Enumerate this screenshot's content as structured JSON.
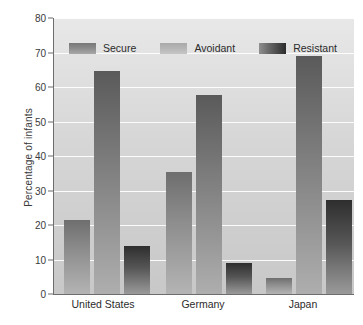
{
  "chart_data": {
    "type": "bar",
    "title": "",
    "xlabel": "",
    "ylabel": "Percentage of infants",
    "ylim": [
      0,
      80
    ],
    "yticks": [
      0,
      10,
      20,
      30,
      40,
      50,
      60,
      70,
      80
    ],
    "grid": true,
    "legend_position": "top-inside",
    "categories": [
      "United States",
      "Germany",
      "Japan"
    ],
    "series": [
      {
        "name": "Secure",
        "values": [
          21.5,
          35.3,
          4.5
        ]
      },
      {
        "name": "Avoidant",
        "values": [
          64.5,
          57.8,
          69.0
        ]
      },
      {
        "name": "Resistant",
        "values": [
          14.0,
          9.0,
          27.2
        ]
      }
    ]
  },
  "axes": {
    "y_label": "Percentage of infants",
    "y_tick_labels": [
      "80",
      "70",
      "60",
      "50",
      "40",
      "30",
      "20",
      "10",
      "0"
    ],
    "x_tick_labels": [
      "United States",
      "Germany",
      "Japan"
    ]
  },
  "legend": {
    "entries": [
      {
        "label": "Secure",
        "swatch": "secure-swatch"
      },
      {
        "label": "Avoidant",
        "swatch": "avoidant-swatch"
      },
      {
        "label": "Resistant",
        "swatch": "resistant-swatch"
      }
    ]
  },
  "caption": {
    "text": ""
  },
  "colors": {
    "secure": "#8b8b8b",
    "avoidant": "#aeaeae",
    "resistant": "#3a3a3a",
    "plot_background": "#d6d6d6",
    "gridline": "#ffffff",
    "axis": "#6d6d6d",
    "text": "#2b2b2b"
  }
}
